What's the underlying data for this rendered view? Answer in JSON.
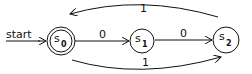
{
  "diagram": {
    "type": "finite-automaton",
    "start_label": "start",
    "states": [
      {
        "id": "s0",
        "name": "s",
        "subscript": "0",
        "accepting": true,
        "start": true
      },
      {
        "id": "s1",
        "name": "s",
        "subscript": "1",
        "accepting": false
      },
      {
        "id": "s2",
        "name": "s",
        "subscript": "2",
        "accepting": false
      }
    ],
    "transitions": [
      {
        "from": "s0",
        "to": "s1",
        "label": "0"
      },
      {
        "from": "s1",
        "to": "s2",
        "label": "0"
      },
      {
        "from": "s2",
        "to": "s0",
        "label": "1"
      },
      {
        "from": "s0",
        "to": "s2",
        "label": "1"
      }
    ],
    "colors": {
      "stroke": "#111111",
      "background": "#ffffff"
    }
  }
}
